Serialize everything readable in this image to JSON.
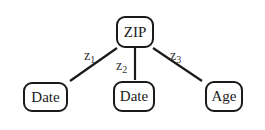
{
  "diagram": {
    "type": "tree",
    "root": {
      "id": "zip",
      "label": "ZIP"
    },
    "children": [
      {
        "id": "date1",
        "label": "Date",
        "edge_label": {
          "base": "z",
          "sub": "1"
        }
      },
      {
        "id": "date2",
        "label": "Date",
        "edge_label": {
          "base": "z",
          "sub": "2"
        }
      },
      {
        "id": "age",
        "label": "Age",
        "edge_label": {
          "base": "z",
          "sub": "3"
        }
      }
    ]
  },
  "colors": {
    "stroke": "#1a1a1a",
    "background": "#ffffff"
  }
}
